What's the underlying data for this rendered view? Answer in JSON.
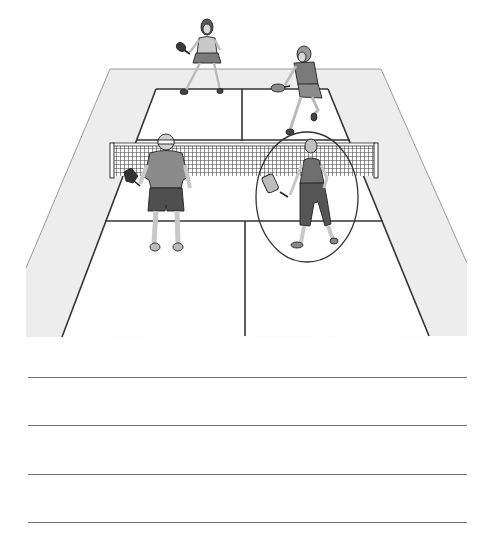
{
  "worksheet": {
    "illustration": {
      "description": "Pickleball doubles match viewed from behind the near baseline",
      "colors": {
        "background": "#ffffff",
        "apron": "#ededed",
        "court": "#ffffff",
        "lines": "#333333",
        "net_mesh": "#3a3a3a",
        "shirt_dark": "#8a8a8a",
        "shorts_dark": "#4f4f4f",
        "skin": "#d9d9d9",
        "hair": "#6a6a6a",
        "highlight_circle": "#333333"
      },
      "players": [
        {
          "id": "far-left",
          "label": "Far-court player, left side (woman in skirt)"
        },
        {
          "id": "far-right",
          "label": "Far-court player, right side (woman lunging with paddle)"
        },
        {
          "id": "near-left",
          "label": "Near-court player, left side (man with headband, back view)"
        },
        {
          "id": "near-right",
          "label": "Near-court player, right side (woman, circled)"
        }
      ],
      "highlight": {
        "target": "near-right",
        "shape": "ellipse"
      }
    },
    "answer_lines": [
      {
        "id": 1,
        "value": ""
      },
      {
        "id": 2,
        "value": ""
      },
      {
        "id": 3,
        "value": ""
      },
      {
        "id": 4,
        "value": ""
      }
    ]
  }
}
